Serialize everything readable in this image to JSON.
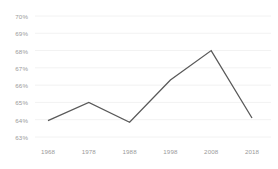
{
  "chart_data": {
    "type": "line",
    "title": "",
    "xlabel": "",
    "ylabel": "",
    "categories": [
      "1968",
      "1978",
      "1988",
      "1998",
      "2008",
      "2018"
    ],
    "x": [
      1968,
      1978,
      1988,
      1998,
      2008,
      2018
    ],
    "values": [
      63.95,
      65.0,
      63.85,
      66.3,
      68.0,
      64.1
    ],
    "value_suffix": "%",
    "series": [
      {
        "name": "",
        "values": [
          63.95,
          65.0,
          63.85,
          66.3,
          68.0,
          64.1
        ],
        "color": "#595959"
      }
    ],
    "ylim": [
      63,
      70
    ],
    "yticks": [
      63,
      64,
      65,
      66,
      67,
      68,
      69,
      70
    ],
    "ytick_labels": [
      "63%",
      "64%",
      "65%",
      "66%",
      "67%",
      "68%",
      "69%",
      "70%"
    ],
    "xtick_labels": [
      "1968",
      "1978",
      "1988",
      "1998",
      "2008",
      "2018"
    ],
    "grid": true,
    "grid_color": "#f2f2f2",
    "legend": false,
    "legend_position": "none",
    "background_color": "#ffffff",
    "line_color": "#595959",
    "line_width": 1.3,
    "markers": false,
    "tick_label_color": "#9a9a9a"
  }
}
